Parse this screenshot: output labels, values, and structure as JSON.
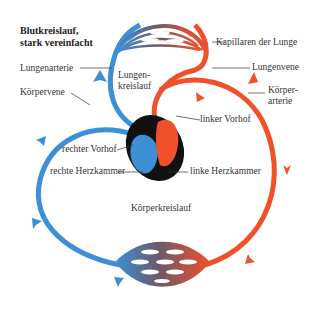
{
  "title": {
    "line1": "Blutkreislauf,",
    "line2": "stark vereinfacht"
  },
  "labels": {
    "lungenarterie": "Lungenarterie",
    "koerpervene": "Körpervene",
    "lungenkreislauf_1": "Lungen-",
    "lungenkreislauf_2": "kreislauf",
    "kapillaren": "Kapillaren der Lunge",
    "lungenvene": "Lungenvene",
    "koerperarterie_1": "Körper-",
    "koerperarterie_2": "arterie",
    "linker_vorhof": "linker Vorhof",
    "rechter_vorhof": "rechter Vorhof",
    "rechte_herzkammer": "rechte Herzkammer",
    "linke_herzkammer": "linke Herzkammer",
    "koerperkreislauf": "Körperkreislauf"
  },
  "colors": {
    "venous_blue": "#3d8fd6",
    "arterial_red": "#f0502a",
    "heart_outline": "#111111",
    "label_text": "#333333"
  }
}
